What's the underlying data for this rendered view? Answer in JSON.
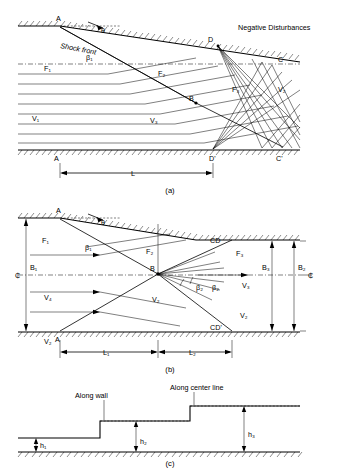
{
  "document": {
    "title": "Supersonic flow over a wall with shock front and expansion fan"
  },
  "panels": [
    {
      "id": "a",
      "caption": "(a)",
      "labels": [
        {
          "key": "A_top",
          "text": "A"
        },
        {
          "key": "theta",
          "text": "θ"
        },
        {
          "key": "shock_front",
          "text": "Shock front"
        },
        {
          "key": "beta1",
          "text": "β₁"
        },
        {
          "key": "F1",
          "text": "F₁"
        },
        {
          "key": "F2",
          "text": "F₂"
        },
        {
          "key": "F3",
          "text": "F₃"
        },
        {
          "key": "D",
          "text": "D"
        },
        {
          "key": "C",
          "text": "C"
        },
        {
          "key": "negative_disturbances",
          "text": "Negative Disturbances"
        },
        {
          "key": "B",
          "text": "B"
        },
        {
          "key": "V1",
          "text": "V₁"
        },
        {
          "key": "V2",
          "text": "V₂"
        },
        {
          "key": "V3",
          "text": "V₃"
        },
        {
          "key": "A_bottom",
          "text": "A"
        },
        {
          "key": "Dprime",
          "text": "D'"
        },
        {
          "key": "Cprime",
          "text": "C'"
        },
        {
          "key": "L",
          "text": "L"
        }
      ]
    },
    {
      "id": "b",
      "caption": "(b)",
      "labels": [
        {
          "key": "A_top",
          "text": "A"
        },
        {
          "key": "theta",
          "text": "θ"
        },
        {
          "key": "beta1",
          "text": "β₁"
        },
        {
          "key": "F1",
          "text": "F₁"
        },
        {
          "key": "F2",
          "text": "F₂"
        },
        {
          "key": "F3",
          "text": "F₃"
        },
        {
          "key": "CD",
          "text": "CD"
        },
        {
          "key": "CDprime",
          "text": "CD'"
        },
        {
          "key": "B1",
          "text": "B₁"
        },
        {
          "key": "B2",
          "text": "B₂"
        },
        {
          "key": "B3",
          "text": "B₃"
        },
        {
          "key": "B",
          "text": "B"
        },
        {
          "key": "centerline_left",
          "text": "₵"
        },
        {
          "key": "centerline_right",
          "text": "₵"
        },
        {
          "key": "beta2",
          "text": "β₂"
        },
        {
          "key": "beta2b",
          "text": "β₂"
        },
        {
          "key": "V2_mid",
          "text": "V₂"
        },
        {
          "key": "V2_right",
          "text": "V₂"
        },
        {
          "key": "V3",
          "text": "V₃"
        },
        {
          "key": "V4",
          "text": "V₄"
        },
        {
          "key": "V2_bottom",
          "text": "V₂"
        },
        {
          "key": "A_bottom",
          "text": "A"
        },
        {
          "key": "L1",
          "text": "L₁"
        },
        {
          "key": "L2",
          "text": "L₂"
        }
      ]
    },
    {
      "id": "c",
      "caption": "(c)",
      "labels": [
        {
          "key": "along_wall",
          "text": "Along wall"
        },
        {
          "key": "along_center_line",
          "text": "Along center line"
        },
        {
          "key": "h1",
          "text": "h₁"
        },
        {
          "key": "h2",
          "text": "h₂"
        },
        {
          "key": "h3",
          "text": "h₃"
        }
      ]
    }
  ],
  "style": {
    "stroke": "#000000",
    "background": "#ffffff"
  }
}
